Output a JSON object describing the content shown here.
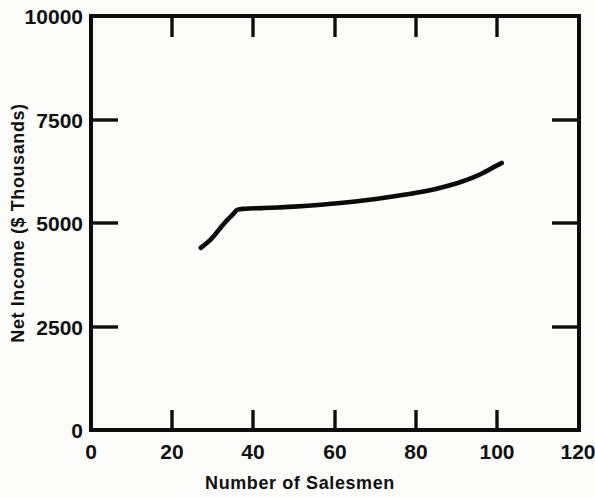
{
  "chart_data": {
    "type": "line",
    "title": "",
    "subtitle": "",
    "xlabel": "Number of Salesmen",
    "ylabel": "Net Income ($ Thousands)",
    "xlim": [
      0,
      120
    ],
    "ylim": [
      0,
      10000
    ],
    "xticks": [
      0,
      20,
      40,
      60,
      80,
      100,
      120
    ],
    "xtick_labels": [
      "0",
      "20",
      "40",
      "60",
      "80",
      "100",
      "120"
    ],
    "yticks": [
      0,
      2500,
      5000,
      7500,
      10000
    ],
    "ytick_labels": [
      "0",
      "2500",
      "5000",
      "7500",
      "10000"
    ],
    "grid": false,
    "legend": null,
    "legend_position": "none",
    "frame": "full-box",
    "tick_direction": "in",
    "series": [
      {
        "name": "Net Income",
        "color": "#0a0a0a",
        "x": [
          27,
          29,
          31,
          33,
          35,
          36,
          38,
          42,
          46,
          50,
          55,
          60,
          65,
          70,
          75,
          80,
          85,
          90,
          94,
          97,
          99,
          101
        ],
        "y": [
          4400,
          4560,
          4780,
          5020,
          5220,
          5320,
          5345,
          5360,
          5375,
          5395,
          5430,
          5470,
          5520,
          5580,
          5650,
          5730,
          5830,
          5960,
          6100,
          6240,
          6350,
          6450
        ]
      }
    ],
    "annotations": []
  },
  "figure": {
    "background_color": "#fcfcfa",
    "axis_color": "#0d0d0d",
    "text_color": "#111111"
  }
}
